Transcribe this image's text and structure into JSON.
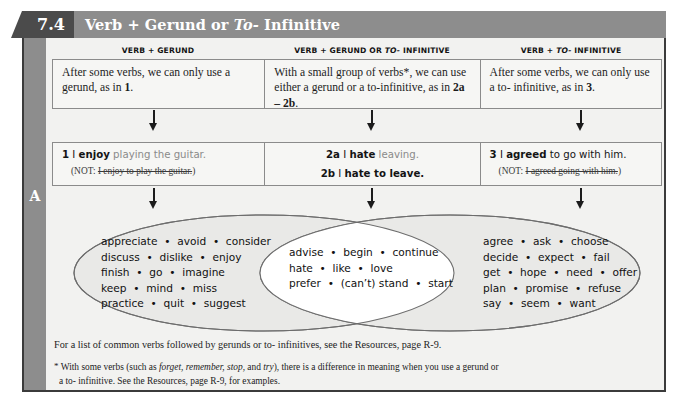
{
  "header": {
    "number": "7.4",
    "title_prefix": "Verb + Gerund or ",
    "title_italic": "To-",
    "title_suffix": " Infinitive",
    "bar_color": "#8d8d8d",
    "number_color": "#4b4b4b"
  },
  "section_label": "A",
  "columns": [
    {
      "head_prefix": "VERB + GERUND",
      "head_italic": "",
      "head_suffix": ""
    },
    {
      "head_prefix": "VERB + GERUND OR ",
      "head_italic": "TO-",
      "head_suffix": " INFINITIVE"
    },
    {
      "head_prefix": "VERB + ",
      "head_italic": "TO-",
      "head_suffix": " INFINITIVE"
    }
  ],
  "descriptions": {
    "left_a": "After some verbs, we can only use a gerund, as in ",
    "left_b": "1",
    "left_c": ".",
    "mid_a": "With a small group of verbs*, we can use either a gerund or a to-infinitive, as in ",
    "mid_b": "2a – 2b",
    "mid_c": ".",
    "right_a": "After some verbs, we can only use a to- infinitive, as in ",
    "right_b": "3",
    "right_c": "."
  },
  "examples": {
    "left": {
      "num": "1",
      "subject": " I ",
      "verb": "enjoy",
      "rest_gray": " playing the guitar.",
      "not_prefix": "(NOT: ",
      "not_struck": "I enjoy to play the guitar.",
      "not_suffix": ")"
    },
    "mid": {
      "a_num": "2a",
      "a_subject": " I ",
      "a_verb": "hate",
      "a_rest_gray": " leaving.",
      "b_num": "2b",
      "b_subject": " I ",
      "b_verb": "hate",
      "b_rest": " to leave."
    },
    "right": {
      "num": "3",
      "subject": " I ",
      "verb": "agreed",
      "rest": " to go with him.",
      "not_prefix": "(NOT: ",
      "not_struck": "I agreed going with him.",
      "not_suffix": ")"
    }
  },
  "venn": {
    "left_lines": [
      "appreciate  •  avoid  •  consider",
      "discuss  •  dislike  •  enjoy",
      "finish  •  go  •  imagine",
      "keep  •  mind  •  miss",
      "practice  •  quit  •  suggest"
    ],
    "middle_lines": [
      "advise  •  begin  •  continue",
      "hate  •  like  •  love",
      "prefer  •  (can’t) stand  •  start"
    ],
    "right_lines": [
      "agree  •  ask  •  choose",
      "decide  •  expect  •  fail",
      "get  •  hope  •  need  •  offer",
      "plan  •  promise  •  refuse",
      "say  •  seem  •  want"
    ],
    "ellipse_fill": "#e9e9e7",
    "intersection_fill": "#ffffff",
    "stroke": "#6d6d6d"
  },
  "notes": {
    "note1": "For a list of common verbs followed by gerunds or to- infinitives, see the Resources, page R-9.",
    "note2_star": "*",
    "note2_a": " With some verbs (such as ",
    "note2_italic": "forget, remember, stop,",
    "note2_b": " and ",
    "note2_italic2": "try",
    "note2_c": "), there is a difference in meaning when you use a gerund or",
    "note2_d": "a to- infinitive. See the Resources, page R-9, for examples."
  }
}
